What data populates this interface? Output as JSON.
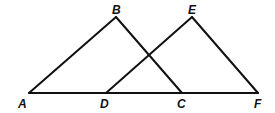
{
  "diagram": {
    "type": "geometry",
    "points": {
      "A": {
        "label": "A",
        "x": 29,
        "y": 93,
        "lx": 18,
        "ly": 108
      },
      "B": {
        "label": "B",
        "x": 116,
        "y": 17,
        "lx": 112,
        "ly": 14
      },
      "C": {
        "label": "C",
        "x": 182,
        "y": 93,
        "lx": 177,
        "ly": 108
      },
      "D": {
        "label": "D",
        "x": 106,
        "y": 93,
        "lx": 100,
        "ly": 108
      },
      "E": {
        "label": "E",
        "x": 192,
        "y": 17,
        "lx": 188,
        "ly": 14
      },
      "F": {
        "label": "F",
        "x": 258,
        "y": 93,
        "lx": 254,
        "ly": 108
      }
    },
    "segments": [
      [
        "A",
        "F"
      ],
      [
        "A",
        "B"
      ],
      [
        "B",
        "C"
      ],
      [
        "D",
        "E"
      ],
      [
        "E",
        "F"
      ]
    ],
    "stroke_color": "#111111"
  }
}
